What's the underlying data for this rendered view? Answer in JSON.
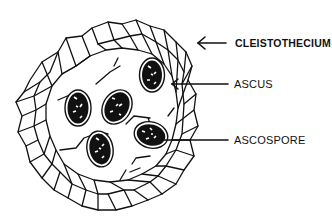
{
  "diagram": {
    "colors": {
      "ink": "#111111",
      "background": "#ffffff"
    },
    "labels": [
      {
        "id": "cleistothecium",
        "text": "CLEISTOTHECIUM",
        "x": 235,
        "y": 37,
        "arrow_from": [
          226,
          43
        ],
        "arrow_to": [
          197,
          43
        ]
      },
      {
        "id": "ascus",
        "text": "ASCUS",
        "x": 234,
        "y": 79,
        "arrow_from": [
          228,
          84
        ],
        "arrow_to": [
          171,
          84
        ]
      },
      {
        "id": "ascospore",
        "text": "ASCOSPORE",
        "x": 234,
        "y": 135,
        "arrow_from": [
          228,
          140
        ],
        "arrow_to": [
          160,
          140
        ]
      }
    ],
    "asci_count": 5
  }
}
